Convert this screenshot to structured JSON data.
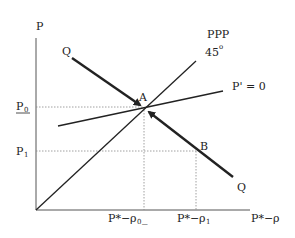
{
  "diagram": {
    "axes": {
      "y_label": "P",
      "x_label": "P*−ρ"
    },
    "curves": {
      "ppp_label": "PPP",
      "angle_label": "45",
      "degree_mark": "o",
      "p_prime_label": "P' = 0",
      "q_top_label": "Q",
      "q_bottom_label": "Q"
    },
    "points": {
      "a_label": "A",
      "b_label": "B"
    },
    "ticks": {
      "p0_main": "P",
      "p0_sub": "0",
      "p1_main": "P",
      "p1_sub": "1",
      "x0_main": "P*−ρ",
      "x0_sub": "0",
      "x0_suffix": "_",
      "x1_main": "P*−ρ",
      "x1_sub": "1"
    },
    "colors": {
      "line": "#222222",
      "guide": "#888888"
    }
  }
}
